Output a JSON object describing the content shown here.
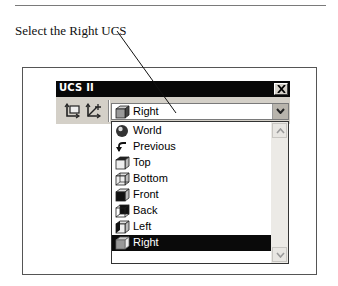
{
  "caption": "Select the Right UCS",
  "window": {
    "title": "UCS II",
    "close_icon": "close-x-icon",
    "toolbar": {
      "icons": [
        "ucs-display-icon",
        "ucs-move-icon"
      ]
    },
    "combo": {
      "selected_value": "Right",
      "selected_icon": "cube-right-face-icon",
      "arrow_icon": "chevron-down-icon"
    }
  },
  "dropdown": {
    "items": [
      {
        "label": "World",
        "icon": "globe-icon"
      },
      {
        "label": "Previous",
        "icon": "undo-arrow-icon"
      },
      {
        "label": "Top",
        "icon": "cube-top-icon"
      },
      {
        "label": "Bottom",
        "icon": "cube-bottom-icon"
      },
      {
        "label": "Front",
        "icon": "cube-front-icon"
      },
      {
        "label": "Back",
        "icon": "cube-back-icon"
      },
      {
        "label": "Left",
        "icon": "cube-left-icon"
      },
      {
        "label": "Right",
        "icon": "cube-right-icon",
        "selected": true
      }
    ]
  },
  "colors": {
    "titlebar": "#080808",
    "window_face": "#d4d0c8",
    "selection": "#0a0a0a"
  }
}
